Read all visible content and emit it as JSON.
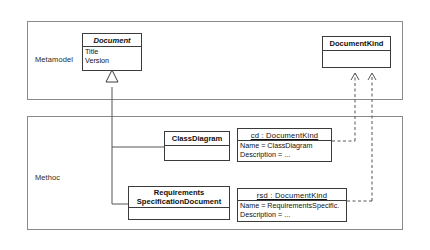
{
  "diagram": {
    "packages": [
      {
        "id": "metamodel",
        "label": "Metamodel"
      },
      {
        "id": "method",
        "label": "Methoc"
      }
    ],
    "classes": [
      {
        "id": "document",
        "name": "Document",
        "stereotype": "abstract",
        "attributes": [
          "Title",
          "Version"
        ]
      },
      {
        "id": "documentkind",
        "name": "DocumentKind",
        "stereotype": "concrete",
        "attributes": []
      },
      {
        "id": "classdiagram",
        "name": "ClassDiagram",
        "stereotype": "concrete",
        "attributes": []
      },
      {
        "id": "requirementsspecificationdocument",
        "name_line1": "Requirements",
        "name_line2": "SpecificationDocument",
        "stereotype": "concrete",
        "attributes": []
      }
    ],
    "objects": [
      {
        "id": "cd",
        "name": "cd : DocumentKind",
        "slots": [
          "Name = ClassDiagram",
          "Description = ..."
        ]
      },
      {
        "id": "rsd",
        "name": "rsd : DocumentKind",
        "slots": [
          "Name = RequirementsSpecific.",
          "Description = ..."
        ]
      }
    ],
    "relations": [
      {
        "type": "generalization",
        "from": "classdiagram",
        "to": "document"
      },
      {
        "type": "generalization",
        "from": "requirementsspecificationdocument",
        "to": "document"
      },
      {
        "type": "dependency",
        "from": "cd",
        "to": "documentkind"
      },
      {
        "type": "dependency",
        "from": "rsd",
        "to": "documentkind"
      }
    ],
    "colors": {
      "border": "#3b3b3b",
      "package_border": "#8a8a8a",
      "line": "#555555",
      "background": "#ffffff",
      "text": "#111111"
    }
  }
}
